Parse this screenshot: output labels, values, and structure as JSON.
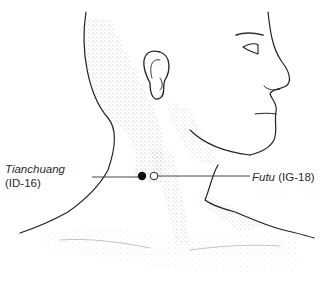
{
  "figure": {
    "points": [
      {
        "name": "Tianchuang",
        "code": "(ID-16)",
        "marker": "filled-circle",
        "marker_color": "#111111",
        "label_side": "left"
      },
      {
        "name": "Futu",
        "code": "(IG-18)",
        "marker": "open-circle",
        "marker_color": "#111111",
        "label_side": "right"
      }
    ],
    "colors": {
      "line": "#222222",
      "stipple": "#555555",
      "background": "#ffffff"
    }
  }
}
